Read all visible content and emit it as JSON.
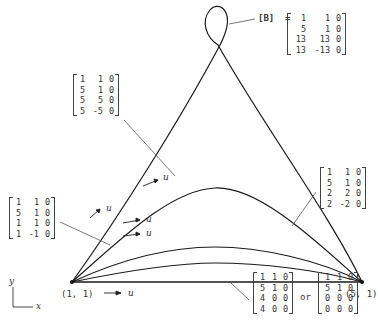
{
  "diagram": {
    "points": {
      "start": "(1, 1)",
      "end": "(5, 1)"
    },
    "param_label": "u",
    "axes": {
      "y": "y",
      "x": "x"
    },
    "B_label": "[B]",
    "equals": "=",
    "or_label": "or",
    "matrices": {
      "loop": [
        [
          "1",
          "1",
          "0"
        ],
        [
          "5",
          "1",
          "0"
        ],
        [
          "13",
          "13",
          "0"
        ],
        [
          "13",
          "-13",
          "0"
        ]
      ],
      "high_arch": [
        [
          "1",
          "1",
          "0"
        ],
        [
          "5",
          "1",
          "0"
        ],
        [
          "5",
          "5",
          "0"
        ],
        [
          "5",
          "-5",
          "0"
        ]
      ],
      "low_left": [
        [
          "1",
          "1",
          "0"
        ],
        [
          "5",
          "1",
          "0"
        ],
        [
          "1",
          "1",
          "0"
        ],
        [
          "1",
          "-1",
          "0"
        ]
      ],
      "mid_right": [
        [
          "1",
          "1",
          "0"
        ],
        [
          "5",
          "1",
          "0"
        ],
        [
          "2",
          "2",
          "0"
        ],
        [
          "2",
          "-2",
          "0"
        ]
      ],
      "straight_a": [
        [
          "1",
          "1",
          "0"
        ],
        [
          "5",
          "1",
          "0"
        ],
        [
          "4",
          "0",
          "0"
        ],
        [
          "4",
          "0",
          "0"
        ]
      ],
      "straight_b": [
        [
          "1",
          "1",
          "0"
        ],
        [
          "5",
          "1",
          "0"
        ],
        [
          "0",
          "0",
          "0"
        ],
        [
          "0",
          "0",
          "0"
        ]
      ]
    },
    "colors": {
      "line": "#1a1a1a",
      "leader": "#555555"
    }
  }
}
